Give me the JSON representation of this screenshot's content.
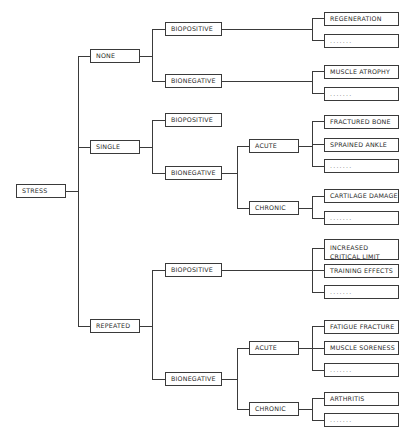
{
  "diagram": {
    "root": {
      "label": "STRESS",
      "children": [
        {
          "label": "NONE",
          "children": [
            {
              "label": "BIOPOSITIVE",
              "children": [
                {
                  "label": "REGENERATION"
                },
                {
                  "label": "......."
                }
              ]
            },
            {
              "label": "BIONEGATIVE",
              "children": [
                {
                  "label": "MUSCLE ATROPHY"
                },
                {
                  "label": "......."
                }
              ]
            }
          ]
        },
        {
          "label": "SINGLE",
          "children": [
            {
              "label": "BIOPOSITIVE"
            },
            {
              "label": "BIONEGATIVE",
              "children": [
                {
                  "label": "ACUTE",
                  "children": [
                    {
                      "label": "FRACTURED BONE"
                    },
                    {
                      "label": "SPRAINED ANKLE"
                    },
                    {
                      "label": "......."
                    }
                  ]
                },
                {
                  "label": "CHRONIC",
                  "children": [
                    {
                      "label": "CARTILAGE DAMAGE"
                    },
                    {
                      "label": "......."
                    }
                  ]
                }
              ]
            }
          ]
        },
        {
          "label": "REPEATED",
          "children": [
            {
              "label": "BIOPOSITIVE",
              "children": [
                {
                  "label_lines": [
                    "INCREASED",
                    "CRITICAL LIMIT"
                  ]
                },
                {
                  "label": "TRAINING EFFECTS"
                },
                {
                  "label": "......."
                }
              ]
            },
            {
              "label": "BIONEGATIVE",
              "children": [
                {
                  "label": "ACUTE",
                  "children": [
                    {
                      "label": "FATIGUE FRACTURE"
                    },
                    {
                      "label": "MUSCLE SORENESS"
                    },
                    {
                      "label": "......."
                    }
                  ]
                },
                {
                  "label": "CHRONIC",
                  "children": [
                    {
                      "label": "ARTHRITIS"
                    },
                    {
                      "label": "......."
                    }
                  ]
                }
              ]
            }
          ]
        }
      ]
    }
  },
  "colors": {
    "line": "#3a3a3a",
    "text": "#2a2a2a",
    "background": "#ffffff"
  }
}
